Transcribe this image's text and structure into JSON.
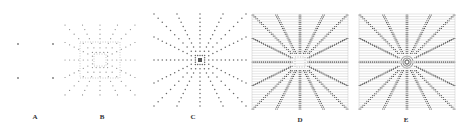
{
  "figure": {
    "panels": [
      {
        "id": "A",
        "label": "A",
        "type": "sparse-dots",
        "description": "Four corner dots"
      },
      {
        "id": "B",
        "label": "B",
        "type": "radial-dots-square",
        "description": "Radial dotted lines with nested squares at center"
      },
      {
        "id": "C",
        "label": "C",
        "type": "radial-dots",
        "description": "Radial dotted rays from center point"
      },
      {
        "id": "D",
        "label": "D",
        "type": "radial-dense-grid",
        "description": "Dense radial dotted rays over horizontal line grid"
      },
      {
        "id": "E",
        "label": "E",
        "type": "radial-dense-grid",
        "description": "Dense radial rays over line grid, central dense region"
      }
    ],
    "colors": {
      "dot": "#666666",
      "dense_dot": "#444444",
      "grid_line": "#bbbbbb",
      "background": "#ffffff"
    }
  }
}
